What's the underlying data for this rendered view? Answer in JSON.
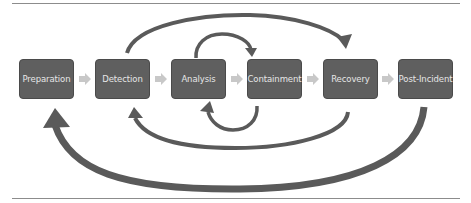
{
  "diagram": {
    "type": "process-flow",
    "steps": [
      {
        "label": "Preparation"
      },
      {
        "label": "Detection"
      },
      {
        "label": "Analysis"
      },
      {
        "label": "Containment"
      },
      {
        "label": "Recovery"
      },
      {
        "label": "Post-Incident"
      }
    ],
    "forward_connectors": [
      {
        "from": "Preparation",
        "to": "Detection"
      },
      {
        "from": "Detection",
        "to": "Analysis"
      },
      {
        "from": "Analysis",
        "to": "Containment"
      },
      {
        "from": "Containment",
        "to": "Recovery"
      },
      {
        "from": "Recovery",
        "to": "Post-Incident"
      }
    ],
    "feedback_arrows": [
      {
        "from": "Detection",
        "to": "Recovery",
        "position": "top"
      },
      {
        "from": "Analysis",
        "to": "Containment",
        "position": "top"
      },
      {
        "from": "Containment",
        "to": "Analysis",
        "position": "bottom"
      },
      {
        "from": "Recovery",
        "to": "Detection",
        "position": "bottom"
      },
      {
        "from": "Post-Incident",
        "to": "Preparation",
        "position": "bottom"
      }
    ],
    "colors": {
      "box_fill": "#5f5f5f",
      "box_text": "#e6e6e6",
      "connector": "#c8c8c8",
      "feedback_arrow": "#5a5a5a",
      "rule": "#8c8c8c"
    }
  }
}
